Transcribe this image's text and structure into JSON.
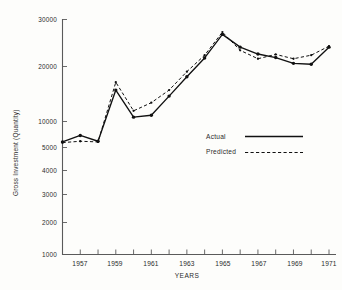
{
  "chart_data": {
    "type": "line",
    "title": "",
    "xlabel": "YEARS",
    "ylabel": "Gross Investment (Quantity)",
    "yscale": "log",
    "ylim": [
      1000,
      30000
    ],
    "xlim": [
      1956,
      1971
    ],
    "grid": false,
    "legend_position": "center-right",
    "ytick_labels": [
      "30000",
      "20000",
      "10000",
      "5000",
      "4000",
      "3000",
      "2000",
      "1000"
    ],
    "ytick_values": [
      30000,
      20000,
      10000,
      5000,
      4000,
      3000,
      2000,
      1000
    ],
    "xtick_labels": [
      "1957",
      "1959",
      "1961",
      "1963",
      "1965",
      "1967",
      "1969",
      "1971"
    ],
    "xtick_values": [
      1957,
      1959,
      1961,
      1963,
      1965,
      1967,
      1969,
      1971
    ],
    "x": [
      1956,
      1957,
      1958,
      1959,
      1960,
      1961,
      1962,
      1963,
      1964,
      1965,
      1966,
      1967,
      1968,
      1969,
      1970,
      1971
    ],
    "series": [
      {
        "name": "Actual",
        "style": "solid",
        "values": [
          5100,
          5600,
          5150,
          10800,
          7300,
          7500,
          9900,
          13100,
          17200,
          24200,
          20100,
          18200,
          17300,
          15900,
          15700,
          20100
        ]
      },
      {
        "name": "Predicted",
        "style": "dashed",
        "values": [
          5050,
          5150,
          5100,
          12100,
          8000,
          9000,
          10800,
          14100,
          17900,
          25000,
          19200,
          17000,
          18100,
          17000,
          17900,
          20400
        ]
      }
    ],
    "legend": [
      {
        "label": "Actual",
        "style": "solid"
      },
      {
        "label": "Predicted",
        "style": "dashed"
      }
    ]
  }
}
